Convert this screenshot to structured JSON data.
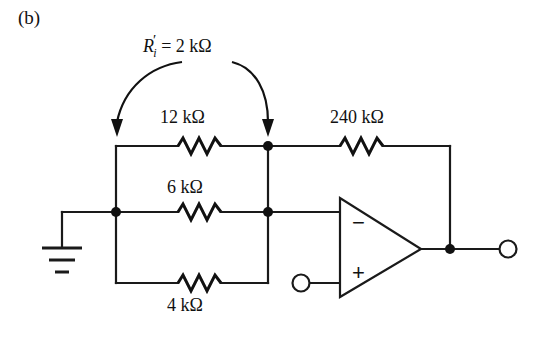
{
  "figure": {
    "panel_label": "(b)",
    "type": "circuit-schematic",
    "background_color": "#ffffff",
    "line_color": "#1a1a1a"
  },
  "annotation": {
    "symbol": "R",
    "prime": "′",
    "subscript": "i",
    "equals": "=",
    "value": "2 kΩ",
    "full_text": "R′i = 2 kΩ",
    "arrow_count": 2,
    "arrow_targets": [
      "left-node-of-12k-branch",
      "right-node-of-12k-branch"
    ]
  },
  "components": {
    "resistors": [
      {
        "name": "r-12k",
        "label": "12 kΩ",
        "value": "12 kΩ",
        "branch": "top-parallel",
        "label_position": "above"
      },
      {
        "name": "r-240k",
        "label": "240 kΩ",
        "value": "240 kΩ",
        "branch": "feedback",
        "label_position": "above"
      },
      {
        "name": "r-6k",
        "label": "6 kΩ",
        "value": "6 kΩ",
        "branch": "middle-parallel",
        "label_position": "above"
      },
      {
        "name": "r-4k",
        "label": "4 kΩ",
        "value": "4 kΩ",
        "branch": "bottom-parallel",
        "label_position": "below"
      }
    ],
    "opamp": {
      "name": "operational-amplifier",
      "inverting_label": "−",
      "noninverting_label": "+",
      "inverting_input": "top",
      "noninverting_input": "bottom"
    },
    "ground": {
      "name": "ground-symbol",
      "bar_count": 3
    },
    "terminals": [
      {
        "name": "noninverting-input-terminal",
        "shape": "open-circle"
      },
      {
        "name": "output-terminal",
        "shape": "open-circle"
      }
    ],
    "junction_dots": 5
  }
}
